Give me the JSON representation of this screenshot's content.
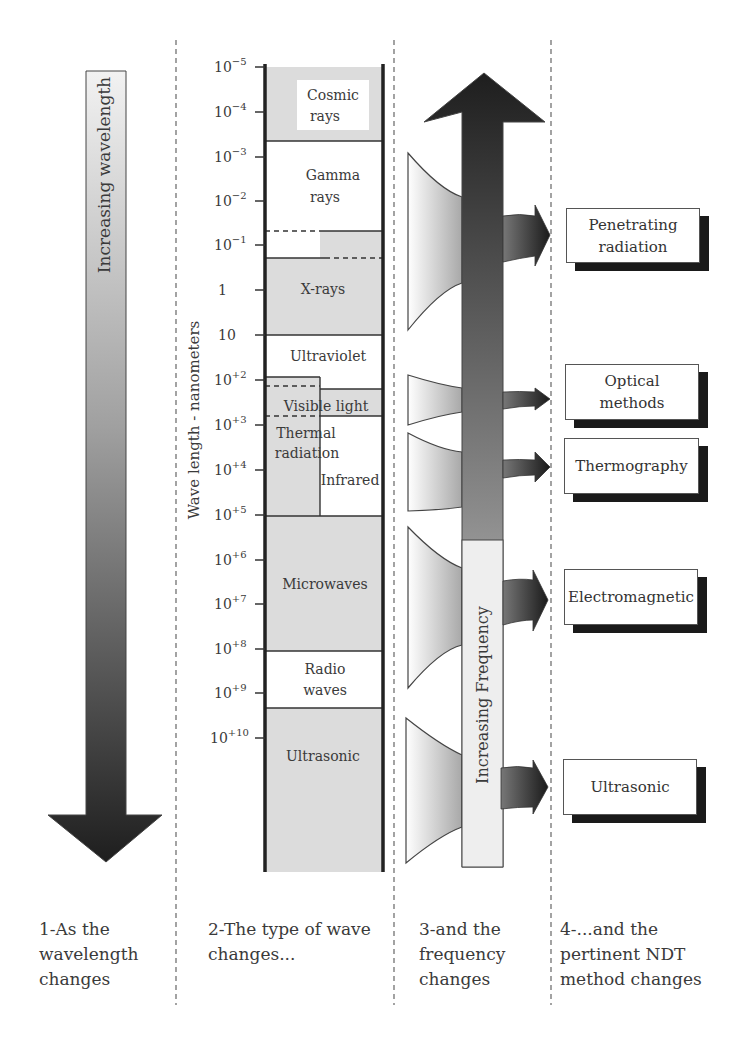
{
  "left_column": {
    "arrow_label": "Increasing wavelength",
    "caption": "1-As the\nwavelength\nchanges"
  },
  "spectrum_column": {
    "axis_label": "Wave length - nanometers",
    "ticks": [
      {
        "base": "10",
        "exp": "−5",
        "y": 67
      },
      {
        "base": "10",
        "exp": "−4",
        "y": 112
      },
      {
        "base": "10",
        "exp": "−3",
        "y": 157
      },
      {
        "base": "10",
        "exp": "−2",
        "y": 201
      },
      {
        "base": "10",
        "exp": "−1",
        "y": 245
      },
      {
        "base": "1",
        "exp": "",
        "y": 290
      },
      {
        "base": "10",
        "exp": "",
        "y": 335
      },
      {
        "base": "10",
        "exp": "+2",
        "y": 380
      },
      {
        "base": "10",
        "exp": "+3",
        "y": 425
      },
      {
        "base": "10",
        "exp": "+4",
        "y": 470
      },
      {
        "base": "10",
        "exp": "+5",
        "y": 515
      },
      {
        "base": "10",
        "exp": "+6",
        "y": 560
      },
      {
        "base": "10",
        "exp": "+7",
        "y": 604
      },
      {
        "base": "10",
        "exp": "+8",
        "y": 649
      },
      {
        "base": "10",
        "exp": "+9",
        "y": 693
      },
      {
        "base": "10",
        "exp": "+10",
        "y": 738
      }
    ],
    "bands": {
      "cosmic": "Cosmic\nrays",
      "gamma": "Gamma\nrays",
      "xrays": "X-rays",
      "ultraviolet": "Ultraviolet",
      "visible": "Visible light",
      "thermal": "Thermal\nradiation",
      "infrared": "Infrared",
      "microwaves": "Microwaves",
      "radio": "Radio\nwaves",
      "ultrasonic": "Ultrasonic"
    },
    "caption": "2-The type of wave\nchanges..."
  },
  "frequency_column": {
    "arrow_label": "Increasing Frequency",
    "caption": "3-and the\nfrequency\nchanges"
  },
  "methods_column": {
    "methods": [
      {
        "label": "Penetrating\nradiation"
      },
      {
        "label": "Optical\nmethods"
      },
      {
        "label": "Thermography"
      },
      {
        "label": "Electromagnetic"
      },
      {
        "label": "Ultrasonic"
      }
    ],
    "caption": "4-...and the\npertinent NDT\nmethod changes"
  },
  "colors": {
    "band_gray": "#dcdcdc",
    "arrow_dark": "#222222",
    "divider": "#666666"
  }
}
